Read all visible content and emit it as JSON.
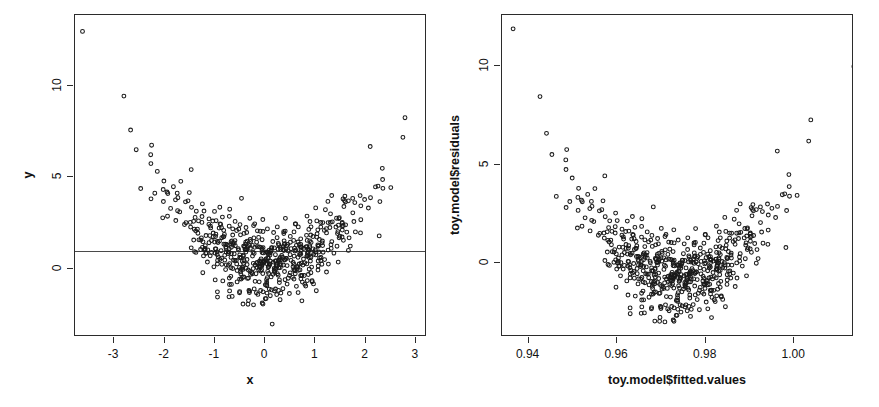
{
  "figure": {
    "background": "#ffffff",
    "foreground": "#2b2b2b",
    "width": 879,
    "height": 407,
    "panels": 2
  },
  "chart_data": [
    {
      "id": "left",
      "type": "scatter",
      "title": "",
      "xlabel": "x",
      "ylabel": "y",
      "xlim": [
        -3.78,
        3.22
      ],
      "ylim": [
        -3.75,
        13.9
      ],
      "xticks": [
        -3,
        -2,
        -1,
        0,
        1,
        2,
        3
      ],
      "xticklabels": [
        "-3",
        "-2",
        "-1",
        "0",
        "1",
        "2",
        "3"
      ],
      "yticks": [
        0,
        5,
        10
      ],
      "yticklabels": [
        "0",
        "5",
        "10"
      ],
      "grid": false,
      "legend": null,
      "point_symbol": "open-circle",
      "point_color": "#1a1a1a",
      "n_points": 600,
      "annotations": [
        {
          "kind": "hline",
          "y": 0.95,
          "color": "#4a4a4a",
          "label": "abline"
        }
      ],
      "relationship": "y = x^2 + noise (U-shaped quadratic cloud)",
      "outliers": [
        {
          "x": -3.63,
          "y": 13.0
        }
      ],
      "series": [
        {
          "name": "y vs x",
          "model": "quadratic",
          "coef": {
            "a": 0.92,
            "b": 0.0,
            "c": 0.25
          },
          "noise_sd": 1.05,
          "x_distribution": "normal(mean=0, sd=1)"
        }
      ]
    },
    {
      "id": "right",
      "type": "scatter",
      "title": "",
      "xlabel": "toy.model$fitted.values",
      "ylabel": "toy.model$residuals",
      "xlim": [
        0.934,
        1.0135
      ],
      "ylim": [
        -3.75,
        12.6
      ],
      "xticks": [
        0.94,
        0.96,
        0.98,
        1.0
      ],
      "xticklabels": [
        "0.94",
        "0.96",
        "0.98",
        "1.00"
      ],
      "yticks": [
        0,
        5,
        10
      ],
      "yticklabels": [
        "0",
        "5",
        "10"
      ],
      "grid": false,
      "legend": null,
      "point_symbol": "open-circle",
      "point_color": "#1a1a1a",
      "n_points": 600,
      "annotations": [],
      "relationship": "residuals vs fitted — U-shaped pattern indicating misspecified linear model",
      "outliers": [
        {
          "x": 0.9365,
          "y": 11.9
        }
      ],
      "series": [
        {
          "name": "residuals vs fitted",
          "model": "quadratic-in-fitted",
          "noise_sd": 1.05
        }
      ]
    }
  ]
}
